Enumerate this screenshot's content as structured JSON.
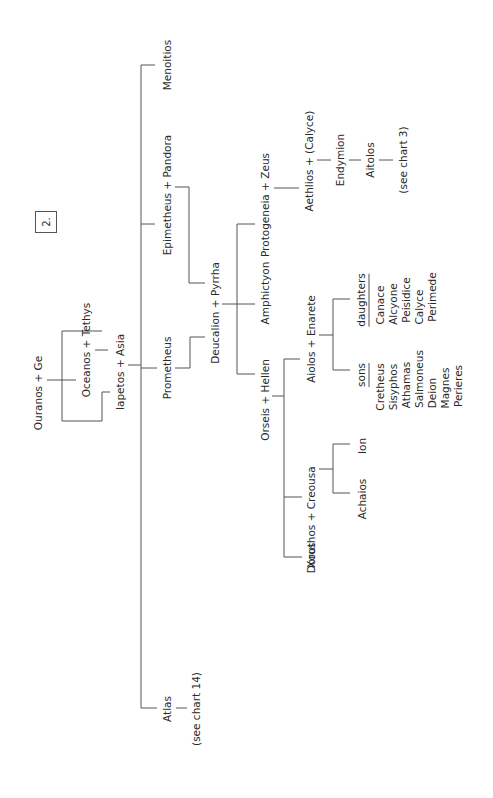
{
  "chart_number": "2.",
  "people": {
    "ouranos_ge": "Ouranos + Ge",
    "oceanos_tethys": "Oceanos + Tethys",
    "iapetos_asia": "Iapetos + Asia",
    "menoitios": "Menoitios",
    "epimetheus_pandora": "Epimetheus + Pandora",
    "prometheus": "Prometheus",
    "atlas": "Atlas",
    "atlas_ref": "(see chart 14)",
    "deucalion_pyrrha": "Deucalion + Pyrrha",
    "protogeneia_zeus": "Protogeneia + Zeus",
    "amphictyon": "Amphictyon",
    "orseis_hellen": "Orseis + Hellen",
    "aethlios_calyce": "Aethlios + (Calyce)",
    "endymion": "Endymion",
    "aitolos": "Aitolos",
    "aitolos_ref": "(see chart 3)",
    "aiolos_enarete": "Aiolos + Enarete",
    "xouthos_creousa": "Xouthos + Creousa",
    "doros": "Doros",
    "ion": "Ion",
    "achaios": "Achaios"
  },
  "sons": {
    "header": "sons",
    "names": [
      "Cretheus",
      "Sisyphos",
      "Athamas",
      "Salmoneus",
      "Deion",
      "Magnes",
      "Perieres"
    ]
  },
  "daughters": {
    "header": "daughters",
    "names": [
      "Canace",
      "Alcyone",
      "Peisidice",
      "Calyce",
      "Perimede"
    ]
  }
}
